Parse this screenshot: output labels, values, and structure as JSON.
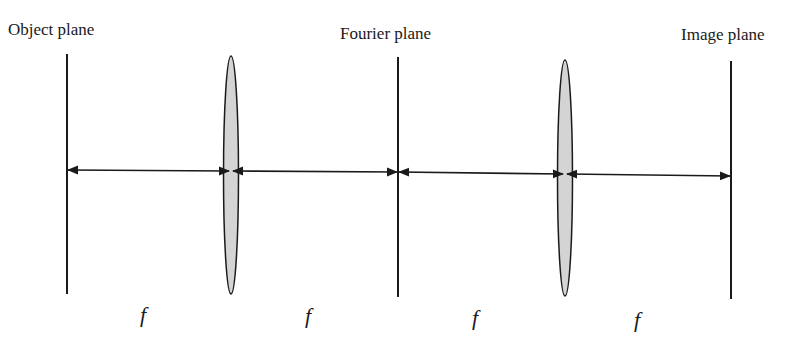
{
  "diagram": {
    "type": "4f optical system",
    "planes": [
      {
        "label": "Object plane",
        "x": 67
      },
      {
        "label": "Fourier plane",
        "x": 398
      },
      {
        "label": "Image plane",
        "x": 731
      }
    ],
    "lenses": [
      {
        "name": "lens-1",
        "x": 231
      },
      {
        "name": "lens-2",
        "x": 565
      }
    ],
    "distances": [
      {
        "label": "f"
      },
      {
        "label": "f"
      },
      {
        "label": "f"
      },
      {
        "label": "f"
      }
    ],
    "colors": {
      "line": "#1a1a1a",
      "lens_fill": "#d4d4d4"
    }
  }
}
